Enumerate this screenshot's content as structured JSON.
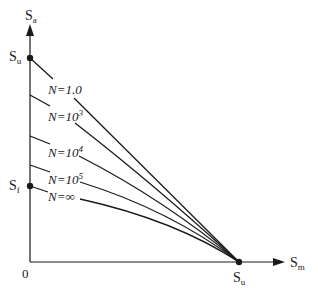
{
  "diagram": {
    "axes": {
      "y_label_main": "S",
      "y_label_sub": "a",
      "x_label_main": "S",
      "x_label_sub": "m",
      "origin_label": "0"
    },
    "points": {
      "su_y_main": "S",
      "su_y_sub": "u",
      "sf_main": "S",
      "sf_sub": "f",
      "su_x_main": "S",
      "su_x_sub": "u"
    },
    "curves": [
      {
        "label_prefix": "N=",
        "label_value": "1.0",
        "label_sup": ""
      },
      {
        "label_prefix": "N=",
        "label_value": "10",
        "label_sup": "3"
      },
      {
        "label_prefix": "N=",
        "label_value": "10",
        "label_sup": "4"
      },
      {
        "label_prefix": "N=",
        "label_value": "10",
        "label_sup": "5"
      },
      {
        "label_prefix": "N=",
        "label_value": "∞",
        "label_sup": ""
      }
    ],
    "colors": {
      "line": "#1a1a1a",
      "background": "#ffffff"
    }
  }
}
